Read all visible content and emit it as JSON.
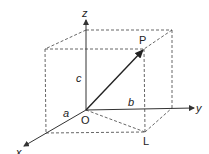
{
  "diagram": {
    "type": "3d-coordinate-box",
    "axes": {
      "x_label": "x",
      "y_label": "y",
      "z_label": "z"
    },
    "points": {
      "origin_label": "O",
      "p_label": "P",
      "l_label": "L"
    },
    "dimensions": {
      "a_label": "a",
      "b_label": "b",
      "c_label": "c"
    },
    "colors": {
      "line": "#333333",
      "dashed": "#555555",
      "background": "#ffffff"
    }
  }
}
